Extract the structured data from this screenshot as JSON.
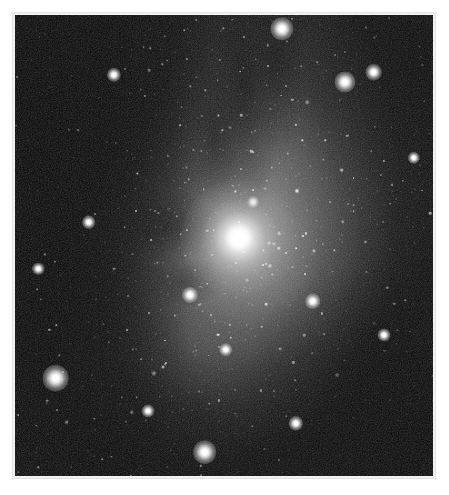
{
  "page": {
    "background_color": "#ffffff",
    "width": 449,
    "height": 495
  },
  "caption": {
    "text": "",
    "note": "clipped line of text at the very top edge; only descenders visible, illegible"
  },
  "figure": {
    "frame_color": "#e2e2e2",
    "mat_color": "#f2f2f2",
    "alt": "grayscale astronomical photograph of a star field with a bright central object and dark dust lanes"
  },
  "chart_data": {
    "type": "scatter",
    "title": "",
    "xlabel": "",
    "ylabel": "",
    "colormap": "grayscale",
    "background_color": "#050505",
    "features": [
      {
        "name": "central-bright-star",
        "x_pct": 53.5,
        "y_pct": 48.3,
        "magnitude": "brightest",
        "has_halo": true
      },
      {
        "name": "diffuse-nebulous-glow",
        "x_pct": 54,
        "y_pct": 50,
        "extent_pct": 44
      },
      {
        "name": "dark-dust-lane-left",
        "x_pct": 10,
        "y_pct": 40,
        "orientation": "upper-left to lower-left arc"
      },
      {
        "name": "dark-dust-lane-upper",
        "x_pct": 56,
        "y_pct": 16,
        "orientation": "vertical streak"
      },
      {
        "name": "dark-sky-lower-right",
        "x_pct": 92,
        "y_pct": 88
      }
    ],
    "bright_stars": [
      {
        "x_pct": 63.8,
        "y_pct": 3.0,
        "size": 7.5
      },
      {
        "x_pct": 79.0,
        "y_pct": 14.6,
        "size": 6.8
      },
      {
        "x_pct": 85.8,
        "y_pct": 12.4,
        "size": 5.4
      },
      {
        "x_pct": 9.7,
        "y_pct": 78.8,
        "size": 8.6
      },
      {
        "x_pct": 45.4,
        "y_pct": 94.8,
        "size": 7.6
      },
      {
        "x_pct": 41.9,
        "y_pct": 60.7,
        "size": 5.2
      },
      {
        "x_pct": 23.6,
        "y_pct": 13.0,
        "size": 4.6
      },
      {
        "x_pct": 50.4,
        "y_pct": 72.6,
        "size": 4.4
      },
      {
        "x_pct": 71.2,
        "y_pct": 62.1,
        "size": 5.0
      },
      {
        "x_pct": 17.6,
        "y_pct": 45.0,
        "size": 4.4
      },
      {
        "x_pct": 88.2,
        "y_pct": 69.4,
        "size": 4.2
      },
      {
        "x_pct": 67.2,
        "y_pct": 88.6,
        "size": 4.6
      },
      {
        "x_pct": 5.6,
        "y_pct": 55.0,
        "size": 4.0
      },
      {
        "x_pct": 31.8,
        "y_pct": 86.0,
        "size": 4.2
      },
      {
        "x_pct": 95.4,
        "y_pct": 31.0,
        "size": 4.0
      },
      {
        "x_pct": 57.0,
        "y_pct": 40.6,
        "size": 3.8
      }
    ],
    "star_count_estimate": 1400
  }
}
